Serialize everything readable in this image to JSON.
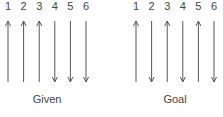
{
  "panels": [
    {
      "caption": "Given",
      "arrows": [
        {
          "label": "1",
          "direction": "up"
        },
        {
          "label": "2",
          "direction": "up"
        },
        {
          "label": "3",
          "direction": "up"
        },
        {
          "label": "4",
          "direction": "down"
        },
        {
          "label": "5",
          "direction": "down"
        },
        {
          "label": "6",
          "direction": "down"
        }
      ]
    },
    {
      "caption": "Goal",
      "arrows": [
        {
          "label": "1",
          "direction": "up"
        },
        {
          "label": "2",
          "direction": "down"
        },
        {
          "label": "3",
          "direction": "up"
        },
        {
          "label": "4",
          "direction": "down"
        },
        {
          "label": "5",
          "direction": "up"
        },
        {
          "label": "6",
          "direction": "down"
        }
      ]
    }
  ]
}
